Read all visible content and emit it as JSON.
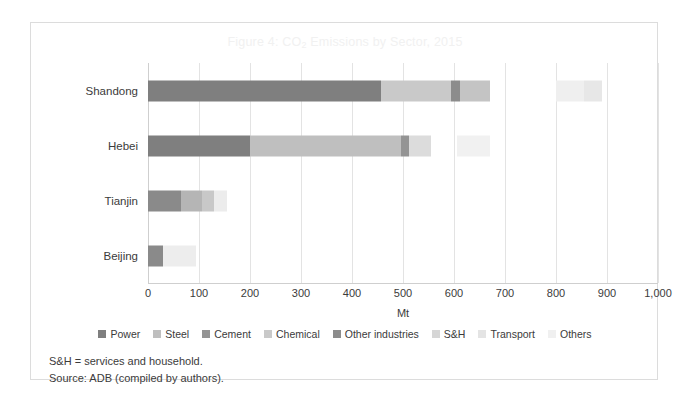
{
  "figure": {
    "title_prefix": "Figure 4: CO",
    "title_sub": "2",
    "title_suffix": " Emissions by Sector, 2015",
    "title_full": "Figure 4: CO2 Emissions by Sector, 2015",
    "title_color": "#f1f1f1"
  },
  "notes": {
    "line1": "S&H = services and household.",
    "line2": "Source: ADB (compiled by authors)."
  },
  "chart_data": {
    "type": "bar",
    "orientation": "horizontal",
    "stacked": true,
    "title": "Figure 4: CO2 Emissions by Sector, 2015",
    "xlabel": "Mt",
    "ylabel": "",
    "xlim": [
      0,
      1000
    ],
    "xticks": [
      0,
      100,
      200,
      300,
      400,
      500,
      600,
      700,
      800,
      900,
      1000
    ],
    "xticklabels": [
      "0",
      "100",
      "200",
      "300",
      "400",
      "500",
      "600",
      "700",
      "800",
      "900",
      "1,000"
    ],
    "grid": "vertical",
    "legend_position": "bottom",
    "categories": [
      "Shandong",
      "Hebei",
      "Tianjin",
      "Beijing"
    ],
    "series": [
      {
        "name": "Power",
        "color": "#7f7f7f",
        "values": [
          457,
          200,
          65,
          30
        ]
      },
      {
        "name": "Steel",
        "color": "#bfbfbf",
        "values": [
          0,
          297,
          0,
          0
        ]
      },
      {
        "name": "Cement",
        "color": "#949494",
        "values": [
          0,
          8,
          0,
          0
        ]
      },
      {
        "name": "Chemical",
        "color": "#c9c9c9",
        "values": [
          145,
          0,
          40,
          0
        ]
      },
      {
        "name": "Other industries",
        "color": "#8c8c8c",
        "values": [
          16,
          0,
          0,
          0
        ]
      },
      {
        "name": "S&H",
        "color": "#d6d6d6",
        "values": [
          52,
          165,
          25,
          65
        ]
      },
      {
        "name": "Transport",
        "color": "#e4e4e4",
        "values": [
          0,
          0,
          25,
          0
        ]
      },
      {
        "name": "Others",
        "color": "#f0f0f0",
        "values": [
          0,
          0,
          0,
          0
        ]
      }
    ],
    "bars": [
      {
        "category": "Shandong",
        "total": 670,
        "detached_total": 890,
        "segments": [
          {
            "series": "Power",
            "start": 0,
            "end": 457,
            "color": "#7f7f7f"
          },
          {
            "series": "Chemical",
            "start": 457,
            "end": 595,
            "color": "#c9c9c9"
          },
          {
            "series": "Other industries",
            "start": 595,
            "end": 612,
            "color": "#8c8c8c"
          },
          {
            "series": "S&H",
            "start": 612,
            "end": 670,
            "color": "#c4c4c4"
          },
          {
            "series": "Transport",
            "start": 800,
            "end": 855,
            "color": "#efefef"
          },
          {
            "series": "Others",
            "start": 855,
            "end": 890,
            "color": "#e7e7e7"
          }
        ]
      },
      {
        "category": "Hebei",
        "total": 670,
        "segments": [
          {
            "series": "Power",
            "start": 0,
            "end": 200,
            "color": "#7f7f7f"
          },
          {
            "series": "Steel",
            "start": 200,
            "end": 497,
            "color": "#bfbfbf"
          },
          {
            "series": "Cement",
            "start": 497,
            "end": 512,
            "color": "#949494"
          },
          {
            "series": "S&H",
            "start": 512,
            "end": 555,
            "color": "#dcdcdc"
          },
          {
            "series": "Transport",
            "start": 605,
            "end": 670,
            "color": "#f1f1f1"
          }
        ]
      },
      {
        "category": "Tianjin",
        "total": 155,
        "segments": [
          {
            "series": "Power",
            "start": 0,
            "end": 65,
            "color": "#8a8a8a"
          },
          {
            "series": "Steel",
            "start": 65,
            "end": 105,
            "color": "#b5b5b5"
          },
          {
            "series": "Chemical",
            "start": 105,
            "end": 130,
            "color": "#c8c8c8"
          },
          {
            "series": "S&H",
            "start": 130,
            "end": 155,
            "color": "#ececec"
          }
        ]
      },
      {
        "category": "Beijing",
        "total": 95,
        "segments": [
          {
            "series": "Power",
            "start": 0,
            "end": 30,
            "color": "#8a8a8a"
          },
          {
            "series": "S&H",
            "start": 30,
            "end": 95,
            "color": "#ededed"
          }
        ]
      }
    ]
  }
}
